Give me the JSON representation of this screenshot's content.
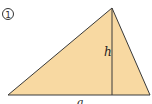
{
  "figure": {
    "number_label": "1",
    "height_label": "h",
    "base_label": "a",
    "fill_color": "#F8D9A2",
    "stroke_color": "#3a3a3a"
  }
}
